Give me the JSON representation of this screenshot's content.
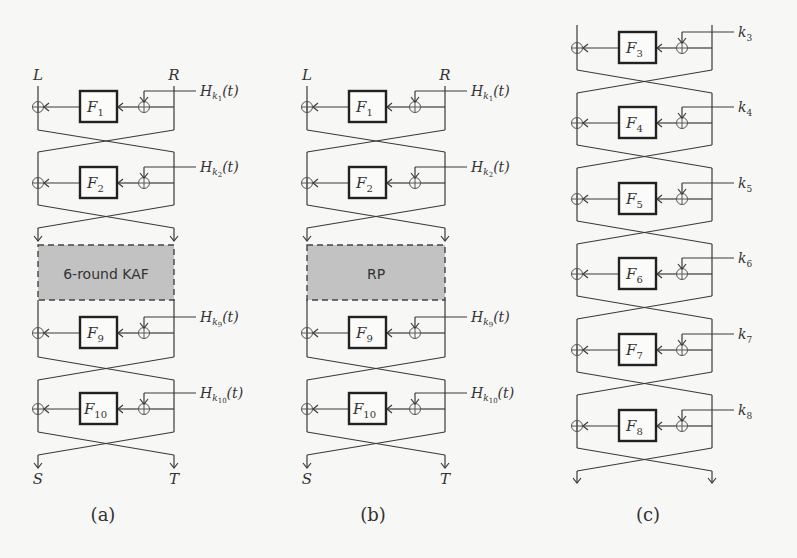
{
  "figure": {
    "panels": [
      {
        "id": "a",
        "caption": "(a)",
        "input_left": "L",
        "input_right": "R",
        "output_left": "S",
        "output_right": "T",
        "middle_block": "6-round KAF",
        "rounds": [
          {
            "f": "F",
            "sub": "1",
            "key": "H",
            "key_sub": "k",
            "key_subsub": "1",
            "key_arg": "(t)"
          },
          {
            "f": "F",
            "sub": "2",
            "key": "H",
            "key_sub": "k",
            "key_subsub": "2",
            "key_arg": "(t)"
          },
          {
            "f": "F",
            "sub": "9",
            "key": "H",
            "key_sub": "k",
            "key_subsub": "9",
            "key_arg": "(t)"
          },
          {
            "f": "F",
            "sub": "10",
            "key": "H",
            "key_sub": "k",
            "key_subsub": "10",
            "key_arg": "(t)"
          }
        ]
      },
      {
        "id": "b",
        "caption": "(b)",
        "input_left": "L",
        "input_right": "R",
        "output_left": "S",
        "output_right": "T",
        "middle_block": "RP",
        "rounds": [
          {
            "f": "F",
            "sub": "1",
            "key": "H",
            "key_sub": "k",
            "key_subsub": "1",
            "key_arg": "(t)"
          },
          {
            "f": "F",
            "sub": "2",
            "key": "H",
            "key_sub": "k",
            "key_subsub": "2",
            "key_arg": "(t)"
          },
          {
            "f": "F",
            "sub": "9",
            "key": "H",
            "key_sub": "k",
            "key_subsub": "9",
            "key_arg": "(t)"
          },
          {
            "f": "F",
            "sub": "10",
            "key": "H",
            "key_sub": "k",
            "key_subsub": "10",
            "key_arg": "(t)"
          }
        ]
      },
      {
        "id": "c",
        "caption": "(c)",
        "rounds": [
          {
            "f": "F",
            "sub": "3",
            "key": "k",
            "key_sub": "3"
          },
          {
            "f": "F",
            "sub": "4",
            "key": "k",
            "key_sub": "4"
          },
          {
            "f": "F",
            "sub": "5",
            "key": "k",
            "key_sub": "5"
          },
          {
            "f": "F",
            "sub": "6",
            "key": "k",
            "key_sub": "6"
          },
          {
            "f": "F",
            "sub": "7",
            "key": "k",
            "key_sub": "7"
          },
          {
            "f": "F",
            "sub": "8",
            "key": "k",
            "key_sub": "8"
          }
        ]
      }
    ],
    "colors": {
      "line": "#3a3a3a",
      "box_border": "#222222",
      "middle_fill": "#c2c2c2",
      "background": "#f7f7f5"
    }
  }
}
